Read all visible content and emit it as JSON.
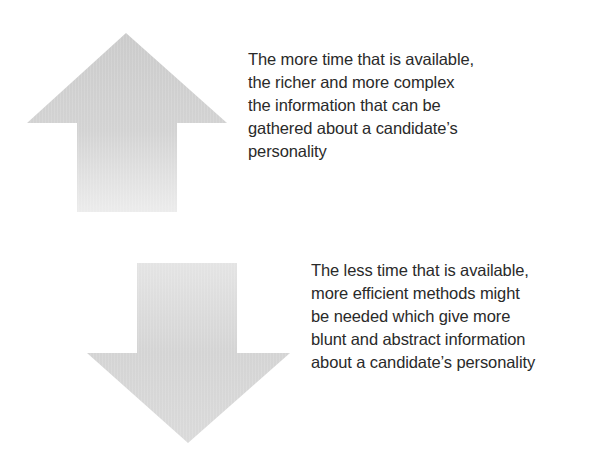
{
  "diagram": {
    "colors": {
      "arrow_dark": "#cecece",
      "arrow_light": "#e8e8e8",
      "text": "#2a2a2a",
      "background": "#ffffff"
    },
    "up_arrow": {
      "icon": "up-arrow-icon",
      "direction": "up",
      "caption_lines": [
        "The more time that is available,",
        "the richer and more complex",
        "the information that can be",
        "gathered about a candidate’s",
        "personality"
      ]
    },
    "down_arrow": {
      "icon": "down-arrow-icon",
      "direction": "down",
      "caption_lines": [
        "The less time that is available,",
        "more efficient methods might",
        "be needed which give more",
        "blunt and abstract information",
        "about a candidate’s personality"
      ]
    }
  }
}
